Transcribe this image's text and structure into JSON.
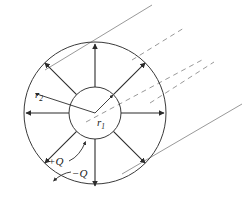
{
  "figure": {
    "name": "coaxial-cable-cross-section",
    "background_color": "#ffffff",
    "width": 249,
    "height": 203,
    "labels": {
      "inner_radius": "r",
      "inner_radius_sub": "1",
      "outer_radius": "r",
      "outer_radius_sub": "2",
      "inner_charge": "+Q",
      "outer_charge": "−Q"
    },
    "geometry": {
      "center_x": 95,
      "center_y": 113,
      "inner_radius_px": 26,
      "outer_radius_px": 71,
      "field_arrow_count": 8,
      "field_arrow_angles_deg": [
        0,
        45,
        90,
        135,
        180,
        225,
        270,
        315
      ]
    },
    "colors": {
      "stroke": "#2b2b2b",
      "circle_stroke": "#3a3a3a",
      "perspective_stroke": "#8d8d8d",
      "label_color": "#1a1a1a"
    },
    "perspective_lines": [
      {
        "name": "top-tangent-solid",
        "style": "solid"
      },
      {
        "name": "upper-mid-dashed",
        "style": "dashed"
      },
      {
        "name": "lower-mid-dashed",
        "style": "dashed"
      },
      {
        "name": "bottom-tangent-solid",
        "style": "solid"
      }
    ]
  }
}
